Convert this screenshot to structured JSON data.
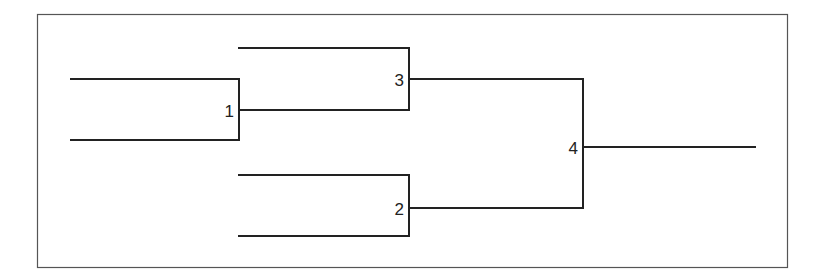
{
  "diagram": {
    "type": "tournament-bracket",
    "nodes": [
      {
        "id": "1",
        "label": "1"
      },
      {
        "id": "2",
        "label": "2"
      },
      {
        "id": "3",
        "label": "3"
      },
      {
        "id": "4",
        "label": "4"
      }
    ],
    "edges": [
      {
        "from": "1",
        "to": "3"
      },
      {
        "from": "3",
        "to": "4"
      },
      {
        "from": "2",
        "to": "4"
      }
    ]
  }
}
